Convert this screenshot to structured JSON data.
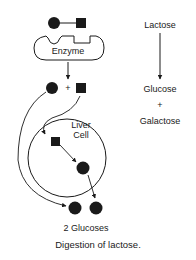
{
  "diagram": {
    "enzyme_label": "Enzyme",
    "plus_sign": "+",
    "liver_cell_label_line1": "Liver",
    "liver_cell_label_line2": "Cell",
    "result_label": "2 Glucoses",
    "caption": "Digestion of lactose."
  },
  "legend": {
    "lactose": "Lactose",
    "glucose": "Glucose",
    "plus": "+",
    "galactose": "Galactose"
  },
  "colors": {
    "ink": "#1a1a1a",
    "background": "#ffffff"
  }
}
